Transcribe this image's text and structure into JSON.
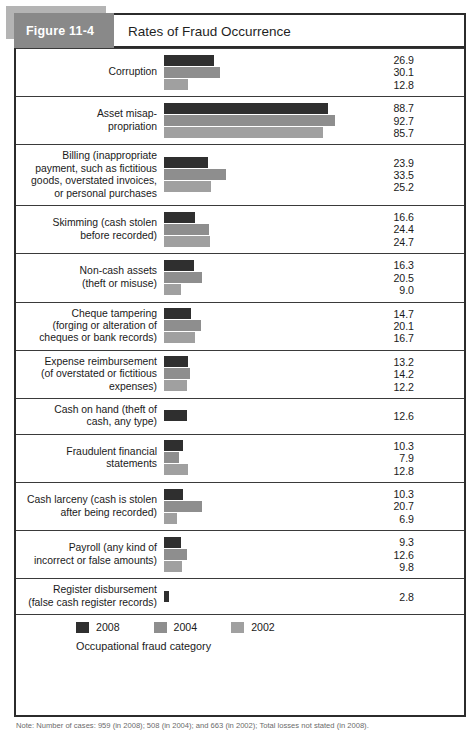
{
  "figure": {
    "badge": "Figure 11-4",
    "title": "Rates of Fraud Occurrence",
    "note": "Note: Number of cases: 959 (in 2008); 508 (in 2004); and 663 (in 2002); Total losses not stated (in 2008)."
  },
  "legend": {
    "items": [
      {
        "label": "2008",
        "color": "#2f2f2f"
      },
      {
        "label": "2004",
        "color": "#8e8e8e"
      },
      {
        "label": "2002",
        "color": "#a0a0a0"
      }
    ]
  },
  "axis_caption": "Occupational fraud category",
  "rows": [
    {
      "label_lines": [
        "Corruption"
      ],
      "values": [
        "26.9",
        "30.1",
        "12.8"
      ]
    },
    {
      "label_lines": [
        "Asset misap-",
        "propriation"
      ],
      "values": [
        "88.7",
        "92.7",
        "85.7"
      ]
    },
    {
      "label_lines": [
        "Billing (inappropriate",
        "payment, such as fictitious",
        "goods, overstated invoices,",
        "or personal purchases"
      ],
      "values": [
        "23.9",
        "33.5",
        "25.2"
      ]
    },
    {
      "label_lines": [
        "Skimming (cash stolen",
        "before recorded)"
      ],
      "values": [
        "16.6",
        "24.4",
        "24.7"
      ]
    },
    {
      "label_lines": [
        "Non-cash assets",
        "(theft or misuse)"
      ],
      "values": [
        "16.3",
        "20.5",
        "9.0"
      ]
    },
    {
      "label_lines": [
        "Cheque tampering",
        "(forging or alteration of",
        "cheques or bank records)"
      ],
      "values": [
        "14.7",
        "20.1",
        "16.7"
      ]
    },
    {
      "label_lines": [
        "Expense reimbursement",
        "(of overstated or fictitious",
        "expenses)"
      ],
      "values": [
        "13.2",
        "14.2",
        "12.2"
      ]
    },
    {
      "label_lines": [
        "Cash on hand (theft of",
        "cash, any type)"
      ],
      "values": [
        "12.6"
      ]
    },
    {
      "label_lines": [
        "Fraudulent financial",
        "statements"
      ],
      "values": [
        "10.3",
        "7.9",
        "12.8"
      ]
    },
    {
      "label_lines": [
        "Cash larceny (cash is stolen",
        "after being recorded)"
      ],
      "values": [
        "10.3",
        "20.7",
        "6.9"
      ]
    },
    {
      "label_lines": [
        "Payroll (any kind of",
        "incorrect or false amounts)"
      ],
      "values": [
        "9.3",
        "12.6",
        "9.8"
      ]
    },
    {
      "label_lines": [
        "Register disbursement",
        "(false cash register records)"
      ],
      "values": [
        "2.8"
      ]
    }
  ],
  "chart_data": {
    "type": "bar",
    "orientation": "horizontal",
    "title": "Rates of Fraud Occurrence",
    "xlabel": "",
    "ylabel": "Occupational fraud category",
    "xlim": [
      0,
      100
    ],
    "grid": false,
    "legend_position": "bottom-left",
    "value_unit": "percent",
    "categories": [
      "Corruption",
      "Asset misappropriation",
      "Billing (inappropriate payment, such as fictitious goods, overstated invoices, or personal purchases)",
      "Skimming (cash stolen before recorded)",
      "Non-cash assets (theft or misuse)",
      "Cheque tampering (forging or alteration of cheques or bank records)",
      "Expense reimbursement (of overstated or fictitious expenses)",
      "Cash on hand (theft of cash, any type)",
      "Fraudulent financial statements",
      "Cash larceny (cash is stolen after being recorded)",
      "Payroll (any kind of incorrect or false amounts)",
      "Register disbursement (false cash register records)"
    ],
    "series": [
      {
        "name": "2008",
        "color": "#2f2f2f",
        "values": [
          26.9,
          88.7,
          23.9,
          16.6,
          16.3,
          14.7,
          13.2,
          12.6,
          10.3,
          10.3,
          9.3,
          2.8
        ]
      },
      {
        "name": "2004",
        "color": "#8e8e8e",
        "values": [
          30.1,
          92.7,
          33.5,
          24.4,
          20.5,
          20.1,
          14.2,
          null,
          7.9,
          20.7,
          12.6,
          null
        ]
      },
      {
        "name": "2002",
        "color": "#a0a0a0",
        "values": [
          12.8,
          85.7,
          25.2,
          24.7,
          9.0,
          16.7,
          12.2,
          null,
          12.8,
          6.9,
          9.8,
          null
        ]
      }
    ]
  }
}
